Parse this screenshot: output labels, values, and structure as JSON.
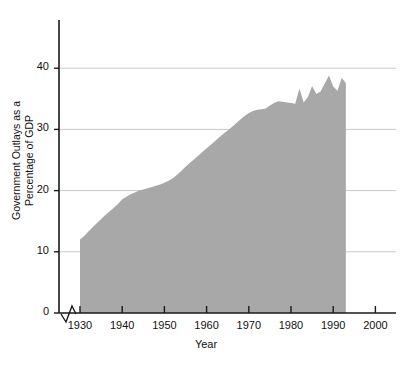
{
  "chart_data": {
    "type": "area",
    "title": "",
    "xlabel": "Year",
    "ylabel": "Government Outlays as a Percentage of GDP",
    "ylabel_lines": [
      "Government Outlays as a",
      "Percentage of GDP"
    ],
    "xlim": [
      1925,
      2003
    ],
    "ylim": [
      0,
      46
    ],
    "yticks": [
      0,
      10,
      20,
      30,
      40
    ],
    "ytick_labels": [
      "0",
      "10",
      "20",
      "30",
      "40"
    ],
    "xticks": [
      1930,
      1940,
      1950,
      1960,
      1970,
      1980,
      1990,
      2000
    ],
    "xtick_labels": [
      "1930",
      "1940",
      "1950",
      "1960",
      "1970",
      "1980",
      "1990",
      "2000"
    ],
    "grid": "horizontal",
    "legend": "none",
    "axis_break_x": true,
    "series_name": "Government Outlays as a Percentage of GDP",
    "fill_color": "#a8a8a8",
    "grid_color": "#c8c8c8",
    "axis_color": "#1a1a1a",
    "data_start_year": 1930,
    "data_end_year": 1993,
    "x": [
      1930,
      1931,
      1932,
      1933,
      1934,
      1935,
      1936,
      1937,
      1938,
      1939,
      1940,
      1941,
      1942,
      1943,
      1944,
      1945,
      1946,
      1947,
      1948,
      1949,
      1950,
      1951,
      1952,
      1953,
      1954,
      1955,
      1956,
      1957,
      1958,
      1959,
      1960,
      1961,
      1962,
      1963,
      1964,
      1965,
      1966,
      1967,
      1968,
      1969,
      1970,
      1971,
      1972,
      1973,
      1974,
      1975,
      1976,
      1977,
      1978,
      1979,
      1980,
      1981,
      1982,
      1983,
      1984,
      1985,
      1986,
      1987,
      1988,
      1989,
      1990,
      1991,
      1992,
      1993
    ],
    "y": [
      12.0,
      12.6,
      13.3,
      14.0,
      14.7,
      15.3,
      16.0,
      16.6,
      17.2,
      17.8,
      18.6,
      19.0,
      19.4,
      19.7,
      20.0,
      20.2,
      20.4,
      20.6,
      20.8,
      21.0,
      21.3,
      21.6,
      22.0,
      22.6,
      23.2,
      23.9,
      24.5,
      25.1,
      25.7,
      26.3,
      26.9,
      27.5,
      28.1,
      28.7,
      29.3,
      29.8,
      30.4,
      31.0,
      31.6,
      32.2,
      32.7,
      33.0,
      33.2,
      33.3,
      33.4,
      33.9,
      34.3,
      34.6,
      34.5,
      34.4,
      34.3,
      34.2,
      36.7,
      34.4,
      35.3,
      37.1,
      35.8,
      36.2,
      37.5,
      38.8,
      37.0,
      36.3,
      38.4,
      37.6
    ]
  },
  "xaxis_label_text": "Year"
}
